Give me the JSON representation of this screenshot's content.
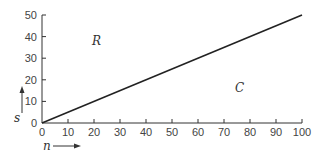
{
  "chart_data": {
    "type": "line",
    "title": "",
    "xlabel": "n",
    "ylabel": "s",
    "xlim": [
      0,
      100
    ],
    "ylim": [
      0,
      50
    ],
    "x_ticks": [
      "0",
      "10",
      "20",
      "30",
      "40",
      "50",
      "60",
      "70",
      "80",
      "90",
      "100"
    ],
    "y_ticks": [
      "0",
      "10",
      "20",
      "30",
      "40",
      "50"
    ],
    "grid": false,
    "series": [
      {
        "name": "boundary",
        "x": [
          0,
          100
        ],
        "y": [
          0,
          50
        ]
      }
    ],
    "annotations": [
      {
        "text": "R",
        "x": 20,
        "y": 38
      },
      {
        "text": "C",
        "x": 75,
        "y": 16
      }
    ]
  }
}
